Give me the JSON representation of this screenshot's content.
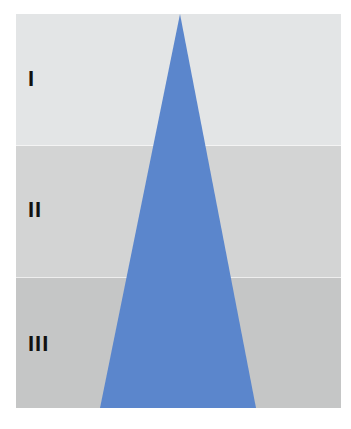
{
  "diagram": {
    "bands": [
      {
        "label": "I",
        "color": "#e3e5e6"
      },
      {
        "label": "II",
        "color": "#d3d4d4"
      },
      {
        "label": "III",
        "color": "#c5c6c6"
      }
    ],
    "triangle": {
      "color": "#5b86cc",
      "orientation": "apex-up"
    }
  }
}
